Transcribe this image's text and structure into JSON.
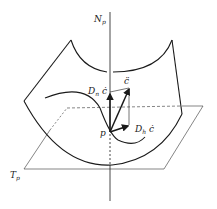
{
  "diagram": {
    "type": "geometric-figure",
    "labels": {
      "normal_line": {
        "main": "N",
        "sub": "p"
      },
      "tangent_plane": {
        "main": "T",
        "sub": "p"
      },
      "point": {
        "main": "p"
      },
      "acceleration": {
        "main": "c̈"
      },
      "normal_component": {
        "main": "D",
        "sub": "n",
        "tail": " ċ"
      },
      "tangent_component": {
        "main": "D",
        "sub": "h",
        "tail": " ċ"
      }
    },
    "colors": {
      "stroke": "#1a1a1a",
      "background": "#ffffff"
    }
  }
}
